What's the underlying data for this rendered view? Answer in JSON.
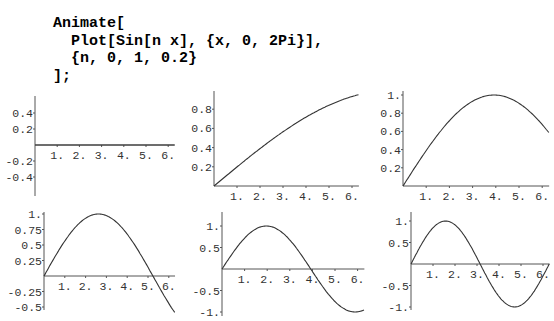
{
  "code": {
    "lines": [
      "Animate[",
      "  Plot[Sin[n x], {x, 0, 2Pi}],",
      "  {n, 0, 1, 0.2}",
      "];"
    ]
  },
  "colors": {
    "axis": "#555555",
    "curve": "#333333",
    "text": "#000000"
  },
  "chart_data": [
    {
      "type": "line",
      "title": "Sin[0 x]",
      "n": 0,
      "x": [
        0,
        6.283
      ],
      "function": "Sin[n x]",
      "xlim": [
        0,
        6.283
      ],
      "ylim": [
        -0.5,
        0.5
      ],
      "xticks": [
        "1.",
        "2.",
        "3.",
        "4.",
        "5.",
        "6."
      ],
      "yticks": [
        "0.4",
        "0.2",
        "-0.2",
        "-0.4"
      ],
      "values_note": "constant 0"
    },
    {
      "type": "line",
      "title": "Sin[0.2 x]",
      "n": 0.2,
      "xlim": [
        0,
        6.283
      ],
      "ylim": [
        0,
        0.95
      ],
      "xticks": [
        "1.",
        "2.",
        "3.",
        "4.",
        "5.",
        "6."
      ],
      "yticks": [
        "0.8",
        "0.6",
        "0.4",
        "0.2"
      ]
    },
    {
      "type": "line",
      "title": "Sin[0.4 x]",
      "n": 0.4,
      "xlim": [
        0,
        6.283
      ],
      "ylim": [
        0,
        1
      ],
      "xticks": [
        "1.",
        "2.",
        "3.",
        "4.",
        "5.",
        "6."
      ],
      "yticks": [
        "1.",
        "0.8",
        "0.6",
        "0.4",
        "0.2"
      ]
    },
    {
      "type": "line",
      "title": "Sin[0.6 x]",
      "n": 0.6,
      "xlim": [
        0,
        6.283
      ],
      "ylim": [
        -0.6,
        1
      ],
      "xticks": [
        "1.",
        "2.",
        "3.",
        "4.",
        "5.",
        "6."
      ],
      "yticks": [
        "1.",
        "0.75",
        "0.5",
        "0.25",
        "-0.25",
        "-0.5"
      ]
    },
    {
      "type": "line",
      "title": "Sin[0.8 x]",
      "n": 0.8,
      "xlim": [
        0,
        6.283
      ],
      "ylim": [
        -1,
        1
      ],
      "xticks": [
        "1.",
        "2.",
        "3.",
        "4.",
        "5.",
        "6."
      ],
      "yticks": [
        "1.",
        "0.5",
        "-0.5",
        "-1."
      ]
    },
    {
      "type": "line",
      "title": "Sin[1 x]",
      "n": 1,
      "xlim": [
        0,
        6.283
      ],
      "ylim": [
        -1,
        1
      ],
      "xticks": [
        "1.",
        "2.",
        "3.",
        "4.",
        "5.",
        "6."
      ],
      "yticks": [
        "1.",
        "0.5",
        "-0.5",
        "-1."
      ]
    }
  ],
  "plots": [
    {
      "ox": 35,
      "oy": 145,
      "sx": 22.2,
      "sy": 80,
      "ytop": 96,
      "ybot": 196,
      "yticks": [
        {
          "v": 0.4,
          "t": "0.4"
        },
        {
          "v": 0.2,
          "t": "0.2"
        },
        {
          "v": -0.2,
          "t": "-0.2"
        },
        {
          "v": -0.4,
          "t": "-0.4"
        }
      ],
      "n": 0
    },
    {
      "ox": 214,
      "oy": 186,
      "sx": 23.0,
      "sy": 96,
      "ytop": 91,
      "ybot": 186,
      "yticks": [
        {
          "v": 0.8,
          "t": "0.8"
        },
        {
          "v": 0.6,
          "t": "0.6"
        },
        {
          "v": 0.4,
          "t": "0.4"
        },
        {
          "v": 0.2,
          "t": "0.2"
        }
      ],
      "n": 0.2
    },
    {
      "ox": 403,
      "oy": 186,
      "sx": 23.2,
      "sy": 91,
      "ytop": 91,
      "ybot": 186,
      "yticks": [
        {
          "v": 1,
          "t": "1."
        },
        {
          "v": 0.8,
          "t": "0.8"
        },
        {
          "v": 0.6,
          "t": "0.6"
        },
        {
          "v": 0.4,
          "t": "0.4"
        },
        {
          "v": 0.2,
          "t": "0.2"
        }
      ],
      "n": 0.4
    },
    {
      "ox": 44,
      "oy": 276,
      "sx": 20.8,
      "sy": 62,
      "ytop": 212,
      "ybot": 310,
      "yticks": [
        {
          "v": 1,
          "t": "1."
        },
        {
          "v": 0.75,
          "t": "0.75"
        },
        {
          "v": 0.5,
          "t": "0.5"
        },
        {
          "v": 0.25,
          "t": "0.25"
        },
        {
          "v": -0.25,
          "t": "-0.25"
        },
        {
          "v": -0.5,
          "t": "-0.5"
        }
      ],
      "n": 0.6
    },
    {
      "ox": 222,
      "oy": 269,
      "sx": 22.6,
      "sy": 43,
      "ytop": 212,
      "ybot": 316,
      "yticks": [
        {
          "v": 1,
          "t": "1."
        },
        {
          "v": 0.5,
          "t": "0.5"
        },
        {
          "v": -0.5,
          "t": "-0.5"
        },
        {
          "v": -1,
          "t": "-1."
        }
      ],
      "n": 0.8
    },
    {
      "ox": 411,
      "oy": 264,
      "sx": 22.0,
      "sy": 43,
      "ytop": 212,
      "ybot": 310,
      "yticks": [
        {
          "v": 1,
          "t": "1."
        },
        {
          "v": 0.5,
          "t": "0.5"
        },
        {
          "v": -0.5,
          "t": "-0.5"
        },
        {
          "v": -1,
          "t": "-1."
        }
      ],
      "n": 1
    }
  ]
}
